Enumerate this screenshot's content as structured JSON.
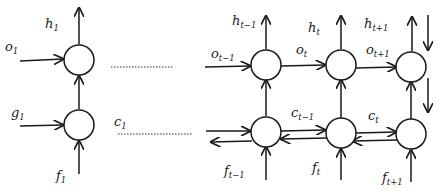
{
  "diagram": {
    "left_unit": {
      "labels": {
        "h": {
          "base": "h",
          "sub": "1"
        },
        "o": {
          "base": "o",
          "sub": "1"
        },
        "g": {
          "base": "g",
          "sub": "1"
        },
        "f": {
          "base": "f",
          "sub": "1"
        },
        "c": {
          "base": "c",
          "sub": "1"
        }
      }
    },
    "right_chain": {
      "h_labels": [
        {
          "base": "h",
          "sub": "t−1"
        },
        {
          "base": "h",
          "sub": "t"
        },
        {
          "base": "h",
          "sub": "t+1"
        }
      ],
      "o_labels": [
        {
          "base": "o",
          "sub": "t−1"
        },
        {
          "base": "o",
          "sub": "t"
        },
        {
          "base": "o",
          "sub": "t+1"
        }
      ],
      "c_labels": [
        {
          "base": "c",
          "sub": "t−1"
        },
        {
          "base": "c",
          "sub": "t"
        }
      ],
      "f_labels": [
        {
          "base": "f",
          "sub": "t−1"
        },
        {
          "base": "f",
          "sub": "t"
        },
        {
          "base": "f",
          "sub": "t+1"
        }
      ]
    },
    "colors": {
      "stroke": "#1a1a1a",
      "background": "#ffffff"
    }
  }
}
